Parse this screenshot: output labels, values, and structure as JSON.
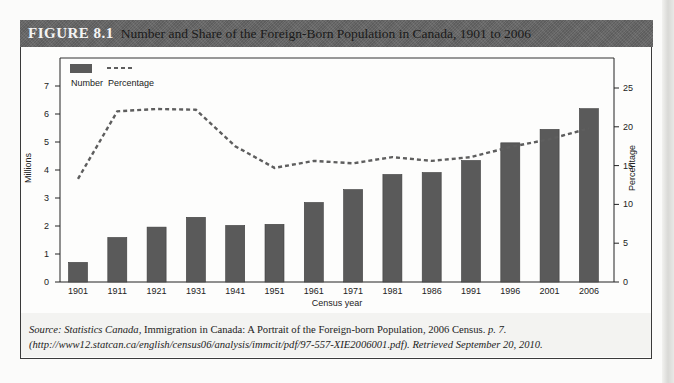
{
  "header": {
    "figure_label": "FIGURE 8.1",
    "title": "Number and Share of the Foreign-Born Population in Canada, 1901 to 2006"
  },
  "legend": {
    "number_label": "Number",
    "percentage_label": "Percentage"
  },
  "axes": {
    "xlabel": "Census year",
    "ylabel_left": "Millions",
    "ylabel_right": "Percentage",
    "left_ticks": [
      "0",
      "1",
      "2",
      "3",
      "4",
      "5",
      "6",
      "7"
    ],
    "right_ticks": [
      "0",
      "5",
      "10",
      "15",
      "20",
      "25"
    ]
  },
  "source": {
    "prefix": "Source: Statistics Canada,",
    "title": " Immigration in Canada: A Portrait of the Foreign-born Population, 2006 Census.",
    "page": " p. 7.",
    "line2": "(http://www12.statcan.ca/english/census06/analysis/immcit/pdf/97-557-XIE2006001.pdf). Retrieved September 20, 2010."
  },
  "colors": {
    "bar": "#5a5a5a",
    "line": "#5e5e5e",
    "header_bg": "#6a6a6a"
  },
  "chart_data": {
    "type": "bar",
    "title": "Number and Share of the Foreign-Born Population in Canada, 1901 to 2006",
    "xlabel": "Census year",
    "ylabel": "Millions",
    "y2label": "Percentage",
    "ylim": [
      0,
      7.5
    ],
    "y2lim": [
      0,
      27
    ],
    "legend_position": "top-left",
    "grid": false,
    "categories": [
      "1901",
      "1911",
      "1921",
      "1931",
      "1941",
      "1951",
      "1961",
      "1971",
      "1981",
      "1986",
      "1991",
      "1996",
      "2001",
      "2006"
    ],
    "series": [
      {
        "name": "Number",
        "type": "bar",
        "axis": "left",
        "values": [
          0.7,
          1.59,
          1.96,
          2.31,
          2.02,
          2.06,
          2.84,
          3.3,
          3.84,
          3.91,
          4.34,
          4.97,
          5.45,
          6.19
        ]
      },
      {
        "name": "Percentage",
        "type": "line",
        "style": "dashed",
        "axis": "right",
        "values": [
          13.3,
          22.0,
          22.3,
          22.2,
          17.5,
          14.7,
          15.6,
          15.3,
          16.1,
          15.6,
          16.1,
          17.4,
          18.4,
          19.8
        ]
      }
    ]
  }
}
